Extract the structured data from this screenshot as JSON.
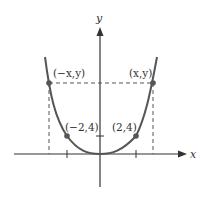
{
  "diagram": {
    "colors": {
      "curve": "#555555",
      "axes": "#333333",
      "dashed": "#555555",
      "points": "#555555"
    },
    "axes": {
      "x_label": "x",
      "y_label": "y"
    },
    "points": [
      {
        "id": "neg-x-y",
        "label": "(−x,y)"
      },
      {
        "id": "x-y",
        "label": "(x,y)"
      },
      {
        "id": "neg-2-4",
        "label": "(−2,4)"
      },
      {
        "id": "2-4",
        "label": "(2,4)"
      }
    ]
  }
}
